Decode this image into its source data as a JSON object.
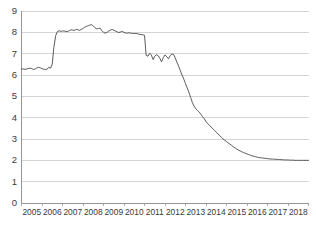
{
  "chart_data": {
    "type": "line",
    "title": "",
    "subtitle": "",
    "xlabel": "",
    "ylabel": "",
    "grid": true,
    "grid_axis": "y",
    "legend": false,
    "legend_position": "none",
    "line_color": "#4a4a4a",
    "grid_color": "#c9c9c9",
    "axis_color": "#8a8a8a",
    "background_color": "#ffffff",
    "xlim": [
      2005,
      2019
    ],
    "ylim": [
      0,
      9
    ],
    "ytick_labels": [
      "9",
      "8",
      "7",
      "6",
      "5",
      "4",
      "3",
      "2",
      "1",
      "0"
    ],
    "ytick_values": [
      9,
      8,
      7,
      6,
      5,
      4,
      3,
      2,
      1,
      0
    ],
    "xtick_labels": [
      "2005",
      "2006",
      "2007",
      "2008",
      "2009",
      "2010",
      "2011",
      "2012",
      "2013",
      "2014",
      "2015",
      "2016",
      "2017",
      "2018"
    ],
    "xtick_values": [
      2005,
      2006,
      2007,
      2008,
      2009,
      2010,
      2011,
      2012,
      2013,
      2014,
      2015,
      2016,
      2017,
      2018
    ],
    "series": [
      {
        "name": "rate",
        "color": "#4a4a4a",
        "x": [
          2005.0,
          2005.08,
          2005.17,
          2005.25,
          2005.33,
          2005.42,
          2005.5,
          2005.58,
          2005.67,
          2005.75,
          2005.83,
          2005.92,
          2006.0,
          2006.08,
          2006.17,
          2006.25,
          2006.33,
          2006.42,
          2006.5,
          2006.58,
          2006.67,
          2006.75,
          2006.83,
          2006.92,
          2007.0,
          2007.08,
          2007.17,
          2007.25,
          2007.33,
          2007.42,
          2007.5,
          2007.58,
          2007.67,
          2007.75,
          2007.83,
          2007.92,
          2008.0,
          2008.08,
          2008.17,
          2008.25,
          2008.33,
          2008.42,
          2008.5,
          2008.58,
          2008.67,
          2008.75,
          2008.83,
          2008.92,
          2009.0,
          2009.08,
          2009.17,
          2009.25,
          2009.33,
          2009.42,
          2009.5,
          2009.58,
          2009.67,
          2009.75,
          2009.83,
          2009.92,
          2010.0,
          2010.08,
          2010.17,
          2010.25,
          2010.33,
          2010.42,
          2010.5,
          2010.58,
          2010.67,
          2010.75,
          2010.83,
          2010.92,
          2011.0,
          2011.04,
          2011.08,
          2011.17,
          2011.25,
          2011.33,
          2011.42,
          2011.5,
          2011.58,
          2011.67,
          2011.75,
          2011.83,
          2011.92,
          2012.0,
          2012.08,
          2012.17,
          2012.25,
          2012.33,
          2012.42,
          2012.5,
          2012.58,
          2012.67,
          2012.75,
          2012.83,
          2012.92,
          2013.0,
          2013.08,
          2013.17,
          2013.25,
          2013.33,
          2013.42,
          2013.5,
          2013.58,
          2013.67,
          2013.75,
          2013.83,
          2013.92,
          2014.0,
          2014.08,
          2014.17,
          2014.25,
          2014.33,
          2014.42,
          2014.5,
          2014.58,
          2014.67,
          2014.75,
          2014.83,
          2014.92,
          2015.0,
          2015.08,
          2015.17,
          2015.25,
          2015.33,
          2015.42,
          2015.5,
          2015.58,
          2015.67,
          2015.75,
          2015.83,
          2015.92,
          2016.0,
          2016.08,
          2016.17,
          2016.25,
          2016.33,
          2016.42,
          2016.5,
          2016.58,
          2016.67,
          2016.75,
          2016.83,
          2016.92,
          2017.0,
          2017.08,
          2017.17,
          2017.25,
          2017.33,
          2017.42,
          2017.5,
          2017.58,
          2017.67,
          2017.75,
          2017.83,
          2017.92,
          2018.0,
          2018.08,
          2018.17,
          2018.25,
          2018.33,
          2018.42,
          2018.5,
          2018.58,
          2018.67,
          2018.75,
          2018.83,
          2018.92,
          2019.0
        ],
        "y": [
          6.28,
          6.28,
          6.27,
          6.28,
          6.3,
          6.32,
          6.3,
          6.26,
          6.28,
          6.33,
          6.36,
          6.34,
          6.3,
          6.27,
          6.26,
          6.27,
          6.36,
          6.32,
          6.52,
          7.3,
          7.85,
          8.04,
          8.07,
          8.05,
          8.06,
          8.07,
          8.03,
          8.04,
          8.08,
          8.12,
          8.1,
          8.09,
          8.14,
          8.12,
          8.09,
          8.14,
          8.18,
          8.24,
          8.28,
          8.31,
          8.34,
          8.36,
          8.3,
          8.22,
          8.16,
          8.18,
          8.2,
          8.08,
          8.0,
          7.96,
          8.0,
          8.06,
          8.1,
          8.13,
          8.1,
          8.06,
          8.02,
          7.99,
          8.02,
          8.04,
          8.0,
          7.97,
          7.96,
          7.98,
          7.96,
          7.95,
          7.94,
          7.95,
          7.93,
          7.91,
          7.9,
          7.88,
          7.86,
          7.4,
          6.92,
          6.88,
          7.02,
          6.95,
          6.72,
          6.88,
          6.95,
          6.9,
          6.78,
          6.62,
          6.82,
          6.94,
          6.86,
          6.76,
          6.9,
          6.98,
          6.96,
          6.8,
          6.6,
          6.4,
          6.2,
          6.0,
          5.8,
          5.6,
          5.4,
          5.18,
          4.95,
          4.72,
          4.54,
          4.42,
          4.34,
          4.26,
          4.16,
          4.05,
          3.94,
          3.82,
          3.72,
          3.64,
          3.56,
          3.48,
          3.4,
          3.32,
          3.24,
          3.16,
          3.08,
          3.0,
          2.94,
          2.88,
          2.82,
          2.76,
          2.7,
          2.64,
          2.58,
          2.53,
          2.48,
          2.44,
          2.4,
          2.36,
          2.33,
          2.3,
          2.27,
          2.24,
          2.21,
          2.19,
          2.17,
          2.15,
          2.13,
          2.12,
          2.11,
          2.1,
          2.09,
          2.08,
          2.07,
          2.06,
          2.06,
          2.05,
          2.05,
          2.04,
          2.04,
          2.03,
          2.03,
          2.02,
          2.02,
          2.02,
          2.01,
          2.01,
          2.01,
          2.0,
          2.0,
          2.0,
          2.0,
          2.0,
          2.0,
          2.0,
          2.0,
          2.0
        ]
      }
    ]
  }
}
